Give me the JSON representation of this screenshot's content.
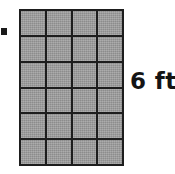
{
  "figure": {
    "kind": "area-model-diagram",
    "background_color": "#ffffff",
    "width": 175,
    "height": 174
  },
  "marker": {
    "name": "bullet-marker",
    "color": "#1a1a1a"
  },
  "shape": {
    "name": "tiled-rectangle",
    "columns": 4,
    "rows": 6,
    "total_tiles": 24,
    "tile_fill_color": "#9a9a9a",
    "grid_line_color": "#1d1d1d",
    "tiles": [
      [
        "tile",
        "tile",
        "tile",
        "tile"
      ],
      [
        "tile",
        "tile",
        "tile",
        "tile"
      ],
      [
        "tile",
        "tile",
        "tile",
        "tile"
      ],
      [
        "tile",
        "tile",
        "tile",
        "tile"
      ],
      [
        "tile",
        "tile",
        "tile",
        "tile"
      ],
      [
        "tile",
        "tile",
        "tile",
        "tile"
      ]
    ]
  },
  "labels": {
    "height_dimension": "6 ft"
  },
  "chart_data": {
    "type": "table",
    "title": "",
    "xlabel": "",
    "ylabel": "",
    "categories": [
      "columns",
      "rows"
    ],
    "values": [
      4,
      6
    ],
    "annotations": [
      "6 ft"
    ]
  }
}
